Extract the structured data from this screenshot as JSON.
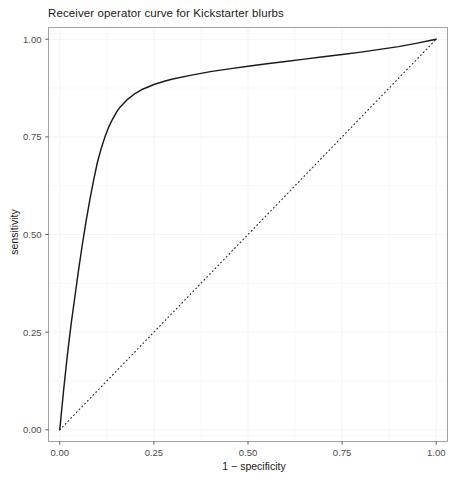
{
  "chart_data": {
    "type": "line",
    "title": "Receiver operator curve for Kickstarter blurbs",
    "xlabel": "1 − specificity",
    "ylabel": "sensitivity",
    "xlim": [
      -0.03,
      1.03
    ],
    "ylim": [
      -0.03,
      1.03
    ],
    "xticks": [
      "0.00",
      "0.25",
      "0.50",
      "0.75",
      "1.00"
    ],
    "xtick_values": [
      0.0,
      0.25,
      0.5,
      0.75,
      1.0
    ],
    "yticks": [
      "0.00",
      "0.25",
      "0.50",
      "0.75",
      "1.00"
    ],
    "ytick_values": [
      0.0,
      0.25,
      0.5,
      0.75,
      1.0
    ],
    "grid": true,
    "legend": "none",
    "series": [
      {
        "name": "roc-curve",
        "style": "solid",
        "color": "#1a1a1a",
        "x": [
          0.0,
          0.005,
          0.01,
          0.015,
          0.02,
          0.025,
          0.03,
          0.04,
          0.05,
          0.06,
          0.07,
          0.08,
          0.09,
          0.1,
          0.11,
          0.12,
          0.13,
          0.14,
          0.15,
          0.16,
          0.18,
          0.2,
          0.22,
          0.25,
          0.28,
          0.3,
          0.35,
          0.4,
          0.45,
          0.5,
          0.55,
          0.6,
          0.65,
          0.7,
          0.75,
          0.8,
          0.85,
          0.9,
          0.95,
          0.98,
          1.0
        ],
        "y": [
          0.0,
          0.05,
          0.1,
          0.145,
          0.19,
          0.23,
          0.27,
          0.34,
          0.41,
          0.475,
          0.535,
          0.59,
          0.64,
          0.685,
          0.72,
          0.75,
          0.775,
          0.795,
          0.812,
          0.826,
          0.846,
          0.861,
          0.872,
          0.884,
          0.893,
          0.898,
          0.908,
          0.917,
          0.924,
          0.931,
          0.937,
          0.943,
          0.949,
          0.955,
          0.961,
          0.967,
          0.974,
          0.981,
          0.99,
          0.996,
          1.0
        ]
      },
      {
        "name": "chance-diagonal",
        "style": "dotted",
        "color": "#2b2b3a",
        "x": [
          0.0,
          1.0
        ],
        "y": [
          0.0,
          1.0
        ]
      }
    ]
  },
  "colors": {
    "panel_background": "#ffffff",
    "panel_border": "#9a9a9a",
    "gridline": "#f4f4f4",
    "tick_mark": "#4d4d4d",
    "tick_label": "#4d4d4d",
    "axis_title": "#1a1a1a",
    "title": "#1a1a1a",
    "curve": "#1a1a1a",
    "diagonal": "#2b2b3a"
  }
}
